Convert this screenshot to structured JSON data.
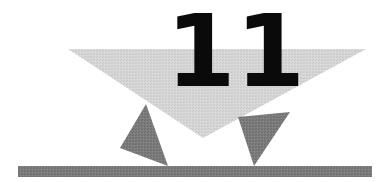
{
  "illustration": {
    "chapter_number": "11",
    "digits": [
      "1",
      "1"
    ],
    "colors": {
      "background": "#ffffff",
      "large_triangle": "#d4d4d4",
      "small_triangles": "#7a7a7a",
      "ground_bar": "#6e6e6e",
      "number": "#0a0a0a"
    }
  }
}
